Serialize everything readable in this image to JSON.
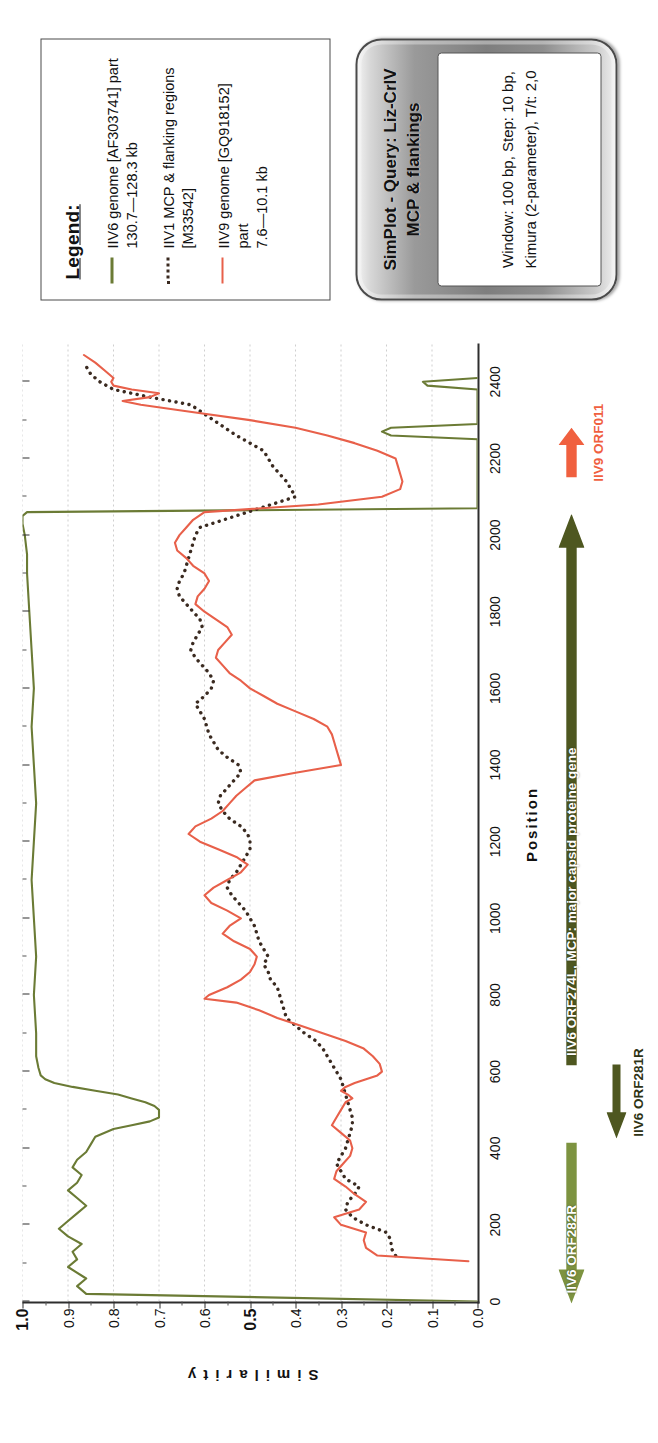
{
  "legend": {
    "title": "Legend:",
    "items": [
      {
        "style": "solid-green",
        "icon": "green-solid-line-swatch",
        "text": "IIV6 genome [AF303741] part\n130.7—128.3 kb"
      },
      {
        "style": "dotted-dark",
        "icon": "dark-dotted-line-swatch",
        "text": "IIV1 MCP & flanking regions\n[M33542]"
      },
      {
        "style": "solid-red",
        "icon": "red-solid-line-swatch",
        "text": "IIV9 genome [GQ918152] part\n7.6—10.1 kb"
      }
    ]
  },
  "plaque": {
    "title_line1": "SimPlot - Query: Liz-CrIV",
    "title_line2": "MCP & flankings",
    "params_line1": "Window: 100 bp, Step: 10 bp,",
    "params_line2": "Kimura (2-parameter), T/t: 2,0"
  },
  "orfs": [
    {
      "name": "IIV6 ORF282R",
      "label": "IIV6 ORF282R",
      "color": "#7d9340",
      "direction": "left",
      "start": 0,
      "end": 420,
      "lane": 0,
      "label_inside": true
    },
    {
      "name": "IIV6 ORF281R",
      "label": "IIV6 ORF281R",
      "color": "#4e5720",
      "direction": "left",
      "start": 430,
      "end": 625,
      "lane": 1,
      "label_inside": false
    },
    {
      "name": "IIV6 ORF274L",
      "label": "IIV6 ORF274L, MCP: major capsid proteine gene",
      "color": "#4e5720",
      "direction": "right",
      "start": 620,
      "end": 2060,
      "lane": 0,
      "label_inside": true
    },
    {
      "name": "IIV9 ORF011",
      "label": "IIV9 ORF011",
      "color": "#f0603f",
      "direction": "right",
      "start": 2155,
      "end": 2285,
      "lane": 0,
      "label_inside": false
    }
  ],
  "chart_data": {
    "type": "line",
    "title": "SimPlot - Query: Liz-CrIV MCP & flankings",
    "xlabel": "Position",
    "ylabel": "Similarity",
    "xlim": [
      0,
      2500
    ],
    "ylim": [
      0,
      1.0
    ],
    "xticks": [
      0,
      200,
      400,
      600,
      800,
      1000,
      1200,
      1400,
      1600,
      1800,
      2000,
      2200,
      2400
    ],
    "yticks": [
      "1.0",
      "0.9",
      "0.8",
      "0.7",
      "0.6",
      "0.5",
      "0.4",
      "0.3",
      "0.2",
      "0.1",
      "0.0"
    ],
    "grid": "horizontal-dotted",
    "legend_position": "outside-top-right",
    "series": [
      {
        "name": "IIV6 genome [AF303741] part 130.7—128.3 kb",
        "color": "#6b7b35",
        "style": "solid",
        "x": [
          0,
          20,
          40,
          60,
          90,
          110,
          130,
          150,
          170,
          190,
          210,
          230,
          250,
          270,
          290,
          310,
          330,
          350,
          370,
          390,
          410,
          430,
          450,
          460,
          470,
          480,
          490,
          500,
          510,
          520,
          530,
          540,
          550,
          560,
          570,
          580,
          590,
          610,
          640,
          700,
          800,
          900,
          1000,
          1100,
          1200,
          1300,
          1400,
          1500,
          1600,
          1700,
          1800,
          1900,
          1950,
          2000,
          2030,
          2050,
          2060,
          2070,
          2250,
          2260,
          2270,
          2280,
          2290,
          2380,
          2390,
          2400,
          2410
        ],
        "y": [
          0.0,
          0.86,
          0.88,
          0.86,
          0.9,
          0.88,
          0.89,
          0.87,
          0.9,
          0.92,
          0.9,
          0.88,
          0.86,
          0.88,
          0.9,
          0.88,
          0.87,
          0.89,
          0.88,
          0.86,
          0.85,
          0.84,
          0.8,
          0.76,
          0.72,
          0.7,
          0.7,
          0.7,
          0.71,
          0.73,
          0.76,
          0.79,
          0.84,
          0.89,
          0.93,
          0.95,
          0.96,
          0.965,
          0.97,
          0.97,
          0.975,
          0.97,
          0.975,
          0.98,
          0.975,
          0.97,
          0.975,
          0.98,
          0.975,
          0.98,
          0.985,
          0.99,
          0.99,
          0.995,
          1.0,
          1.0,
          0.99,
          0.0,
          0.0,
          0.19,
          0.21,
          0.19,
          0.0,
          0.0,
          0.11,
          0.12,
          0.0
        ]
      },
      {
        "name": "IIV1 MCP & flanking regions [M33542]",
        "color": "#3a2a20",
        "style": "dotted",
        "x": [
          120,
          140,
          160,
          180,
          200,
          220,
          240,
          260,
          280,
          300,
          320,
          340,
          360,
          380,
          400,
          420,
          440,
          460,
          480,
          500,
          520,
          540,
          560,
          580,
          600,
          620,
          640,
          660,
          680,
          700,
          720,
          740,
          760,
          780,
          800,
          820,
          840,
          860,
          880,
          900,
          920,
          940,
          960,
          980,
          1000,
          1020,
          1040,
          1060,
          1080,
          1100,
          1120,
          1140,
          1160,
          1180,
          1200,
          1220,
          1240,
          1260,
          1280,
          1300,
          1320,
          1340,
          1360,
          1380,
          1400,
          1420,
          1440,
          1460,
          1480,
          1500,
          1520,
          1540,
          1560,
          1580,
          1600,
          1620,
          1640,
          1660,
          1680,
          1700,
          1720,
          1740,
          1760,
          1780,
          1800,
          1820,
          1840,
          1860,
          1880,
          1900,
          1920,
          1940,
          1960,
          1980,
          2000,
          2020,
          2100,
          2140,
          2180,
          2220,
          2260,
          2300,
          2340,
          2360,
          2380,
          2400,
          2420,
          2440
        ],
        "y": [
          0.18,
          0.19,
          0.19,
          0.2,
          0.245,
          0.275,
          0.29,
          0.285,
          0.27,
          0.26,
          0.29,
          0.3,
          0.31,
          0.3,
          0.29,
          0.285,
          0.28,
          0.275,
          0.275,
          0.28,
          0.285,
          0.29,
          0.295,
          0.3,
          0.31,
          0.32,
          0.33,
          0.34,
          0.355,
          0.38,
          0.4,
          0.42,
          0.425,
          0.43,
          0.435,
          0.44,
          0.455,
          0.46,
          0.47,
          0.46,
          0.47,
          0.48,
          0.485,
          0.49,
          0.5,
          0.51,
          0.525,
          0.54,
          0.55,
          0.545,
          0.53,
          0.52,
          0.51,
          0.5,
          0.5,
          0.505,
          0.52,
          0.545,
          0.56,
          0.57,
          0.565,
          0.55,
          0.535,
          0.52,
          0.525,
          0.55,
          0.57,
          0.58,
          0.59,
          0.595,
          0.6,
          0.61,
          0.62,
          0.6,
          0.585,
          0.58,
          0.59,
          0.605,
          0.62,
          0.63,
          0.625,
          0.615,
          0.605,
          0.61,
          0.625,
          0.64,
          0.655,
          0.66,
          0.655,
          0.645,
          0.64,
          0.635,
          0.63,
          0.625,
          0.62,
          0.61,
          0.4,
          0.42,
          0.45,
          0.47,
          0.53,
          0.58,
          0.63,
          0.72,
          0.8,
          0.83,
          0.85,
          0.86
        ]
      },
      {
        "name": "IIV9 genome [GQ918152] part 7.6—10.1 kb",
        "color": "#e8604a",
        "style": "solid",
        "x": [
          105,
          120,
          140,
          160,
          180,
          200,
          220,
          240,
          260,
          280,
          300,
          320,
          340,
          360,
          380,
          400,
          420,
          440,
          460,
          480,
          500,
          520,
          530,
          540,
          550,
          560,
          570,
          580,
          590,
          600,
          620,
          640,
          660,
          680,
          700,
          720,
          740,
          760,
          780,
          790,
          800,
          820,
          840,
          860,
          880,
          900,
          920,
          940,
          960,
          980,
          1000,
          1020,
          1040,
          1060,
          1080,
          1100,
          1120,
          1140,
          1160,
          1180,
          1200,
          1220,
          1240,
          1260,
          1280,
          1300,
          1320,
          1340,
          1360,
          1380,
          1400,
          1420,
          1440,
          1460,
          1480,
          1500,
          1520,
          1540,
          1560,
          1580,
          1600,
          1620,
          1640,
          1660,
          1680,
          1700,
          1720,
          1740,
          1760,
          1780,
          1800,
          1820,
          1840,
          1860,
          1880,
          1900,
          1920,
          1940,
          1960,
          1980,
          2000,
          2020,
          2040,
          2060,
          2080,
          2100,
          2120,
          2140,
          2160,
          2180,
          2200,
          2220,
          2240,
          2260,
          2280,
          2300,
          2320,
          2340,
          2350,
          2360,
          2370,
          2380,
          2390,
          2400,
          2410,
          2430,
          2450,
          2470
        ],
        "y": [
          0.02,
          0.22,
          0.245,
          0.25,
          0.245,
          0.3,
          0.315,
          0.26,
          0.245,
          0.27,
          0.29,
          0.315,
          0.31,
          0.295,
          0.28,
          0.275,
          0.28,
          0.3,
          0.32,
          0.31,
          0.3,
          0.29,
          0.275,
          0.285,
          0.3,
          0.29,
          0.27,
          0.245,
          0.22,
          0.21,
          0.215,
          0.23,
          0.25,
          0.29,
          0.34,
          0.39,
          0.44,
          0.48,
          0.53,
          0.6,
          0.59,
          0.55,
          0.52,
          0.5,
          0.49,
          0.485,
          0.5,
          0.535,
          0.56,
          0.545,
          0.52,
          0.55,
          0.585,
          0.6,
          0.58,
          0.55,
          0.52,
          0.505,
          0.53,
          0.57,
          0.61,
          0.635,
          0.62,
          0.585,
          0.56,
          0.545,
          0.53,
          0.51,
          0.49,
          0.4,
          0.3,
          0.305,
          0.31,
          0.315,
          0.32,
          0.33,
          0.36,
          0.4,
          0.44,
          0.47,
          0.5,
          0.52,
          0.545,
          0.56,
          0.575,
          0.57,
          0.555,
          0.54,
          0.55,
          0.575,
          0.6,
          0.62,
          0.615,
          0.6,
          0.59,
          0.6,
          0.625,
          0.64,
          0.66,
          0.665,
          0.655,
          0.64,
          0.625,
          0.6,
          0.35,
          0.21,
          0.17,
          0.165,
          0.17,
          0.175,
          0.18,
          0.22,
          0.27,
          0.33,
          0.4,
          0.5,
          0.62,
          0.74,
          0.78,
          0.72,
          0.7,
          0.76,
          0.8,
          0.805,
          0.8,
          0.82,
          0.84,
          0.865
        ]
      }
    ]
  }
}
